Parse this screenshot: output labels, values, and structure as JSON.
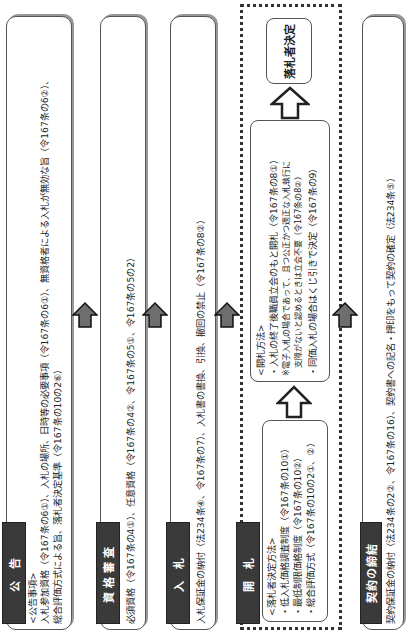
{
  "diagram": {
    "steps": [
      {
        "label": "公 告",
        "heading": "<公告事項>",
        "lines": [
          "入札参加資格（令167条の6①）、入札の場所、日時等の必要事項（令167条の6①）、無資格者による入札が無効な旨（令167条の6②）、",
          "総合評価方式による旨、落札者決定基準（令167条の10の2⑥）"
        ]
      },
      {
        "label": "資格審査",
        "lines": [
          "必須資格（令167条の4①）、任意資格（令167条の4②、令167条の5①、令167条の5の2）"
        ]
      },
      {
        "label": "入 札",
        "lines": [
          "入札保証金の納付（法234条④、令167条の7）、入札書の書換、引換、撤回の禁止（令167条の8②）"
        ]
      },
      {
        "label": "開 札",
        "method_box": {
          "heading": "<落札者決定方法>",
          "lines": [
            "・低入札価格調査制度（令167条の10①）",
            "・最低制限価格制度（令167条の10②）",
            "・総合評価方式（令167条の10の2①、②）"
          ]
        },
        "opening_box": {
          "heading": "<開札方法>",
          "lines": [
            "・入札の終了後職員立会のもと開札（令167条の8①）",
            "※電子入札の場合であって、且つ公正かつ適正な入札執行に",
            "　支障がないと認めるときは立会不要（令167条の8②）",
            "・同価入札の場合はくじ引きで決定（令167条の9）"
          ]
        },
        "result_box": "落札者決定"
      },
      {
        "label": "契約の締結",
        "lines": [
          "契約保証金の納付（法234条の2②、令167条の16）、契約書への記名・押印をもって契約の確定（法234条⑤）"
        ]
      }
    ],
    "arrow_color": "#6e6e6e"
  }
}
